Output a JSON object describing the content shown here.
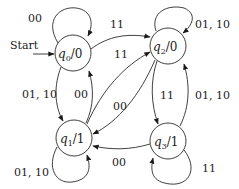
{
  "diagram": {
    "type": "finite-state-machine (Moore)",
    "start_label": "Start",
    "states": [
      {
        "id": "q0",
        "name": "q",
        "sub": "0",
        "output": "0",
        "cx": 73,
        "cy": 53
      },
      {
        "id": "q1",
        "name": "q",
        "sub": "1",
        "output": "1",
        "cx": 74,
        "cy": 138
      },
      {
        "id": "q2",
        "name": "q",
        "sub": "2",
        "output": "0",
        "cx": 168,
        "cy": 46
      },
      {
        "id": "q3",
        "name": "q",
        "sub": "3",
        "output": "1",
        "cx": 168,
        "cy": 141
      }
    ],
    "transitions": [
      {
        "from": "q0",
        "to": "q0",
        "label": "00"
      },
      {
        "from": "q0",
        "to": "q2",
        "label": "11"
      },
      {
        "from": "q0",
        "to": "q1",
        "label": "01, 10"
      },
      {
        "from": "q1",
        "to": "q0",
        "label": "00"
      },
      {
        "from": "q1",
        "to": "q2",
        "label": "11"
      },
      {
        "from": "q2",
        "to": "q1",
        "label": "00"
      },
      {
        "from": "q2",
        "to": "q2",
        "label": "01, 10"
      },
      {
        "from": "q2",
        "to": "q3",
        "label": "11"
      },
      {
        "from": "q3",
        "to": "q2",
        "label": "01, 10"
      },
      {
        "from": "q3",
        "to": "q1",
        "label": "00"
      },
      {
        "from": "q1",
        "to": "q1",
        "label": "01, 10"
      },
      {
        "from": "q3",
        "to": "q3",
        "label": "11"
      }
    ],
    "slash": "/"
  }
}
